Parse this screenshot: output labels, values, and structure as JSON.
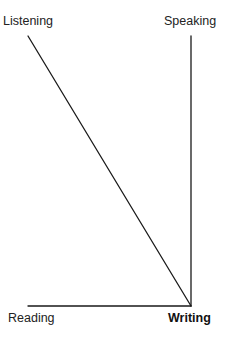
{
  "diagram": {
    "type": "line-diagram",
    "labels": {
      "top_left": "Listening",
      "top_right": "Speaking",
      "bottom_left": "Reading",
      "bottom_right": "Writing"
    },
    "emphasized_label": "Writing",
    "lines": [
      {
        "from": "Listening",
        "to": "Writing",
        "x1": 28,
        "y1": 36,
        "x2": 191,
        "y2": 306
      },
      {
        "from": "Speaking",
        "to": "Writing",
        "x1": 191,
        "y1": 36,
        "x2": 191,
        "y2": 306
      },
      {
        "from": "Reading",
        "to": "Writing",
        "x1": 28,
        "y1": 306,
        "x2": 191,
        "y2": 306
      }
    ],
    "line_color": "#1a1a1a"
  }
}
